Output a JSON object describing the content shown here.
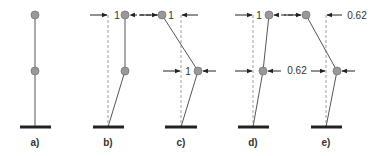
{
  "diagram": {
    "type": "structural mode shapes (two-mass cantilever)",
    "colors": {
      "member": "#555555",
      "node_fill": "#999999",
      "node_stroke": "#777777",
      "ground": "#222222",
      "dashed": "#888888",
      "arrow": "#222222",
      "text": "#333333"
    },
    "panels": [
      {
        "id": "a",
        "caption": "a)",
        "labels": []
      },
      {
        "id": "b",
        "caption": "b)",
        "labels": [
          "1"
        ]
      },
      {
        "id": "c",
        "caption": "c)",
        "labels": [
          "1",
          "1"
        ]
      },
      {
        "id": "d",
        "caption": "d)",
        "labels": [
          "1",
          "0.62"
        ]
      },
      {
        "id": "e",
        "caption": "e)",
        "labels": [
          "0.62",
          "0.62"
        ]
      }
    ]
  }
}
